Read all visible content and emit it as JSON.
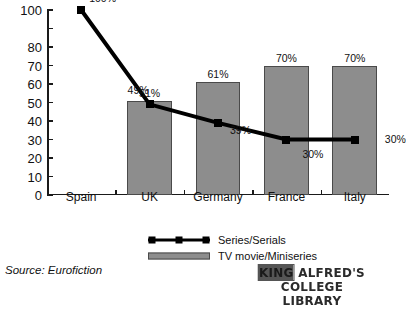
{
  "chart_data": {
    "type": "bar",
    "title": "",
    "xlabel": "",
    "ylabel": "",
    "ylim": [
      0,
      100
    ],
    "grid": false,
    "legend_position": "bottom-center",
    "categories": [
      "Spain",
      "UK",
      "Germany",
      "France",
      "Italy"
    ],
    "y_ticks": [
      {
        "value": 100,
        "label": "100"
      },
      {
        "value": 90,
        "label": ""
      },
      {
        "value": 80,
        "label": "80"
      },
      {
        "value": 70,
        "label": "70"
      },
      {
        "value": 60,
        "label": "60"
      },
      {
        "value": 50,
        "label": "50"
      },
      {
        "value": 40,
        "label": "40"
      },
      {
        "value": 30,
        "label": "30"
      },
      {
        "value": 20,
        "label": "20"
      },
      {
        "value": 10,
        "label": "10"
      },
      {
        "value": 0,
        "label": "0"
      }
    ],
    "series": [
      {
        "name": "Series/Serials",
        "type": "line",
        "values": [
          100,
          49,
          39,
          30,
          30
        ],
        "labels": [
          "100%",
          "49%",
          "39%",
          "30%",
          "30%"
        ]
      },
      {
        "name": "TV movie/Miniseries",
        "type": "bar",
        "values": [
          null,
          51,
          61,
          70,
          70
        ],
        "labels": [
          "",
          "51%",
          "61%",
          "70%",
          "70%"
        ]
      }
    ]
  },
  "legend": {
    "items": [
      {
        "label": "Series/Serials",
        "key": "line-marker-key"
      },
      {
        "label": "TV movie/Miniseries",
        "key": "bar-swatch-key"
      }
    ]
  },
  "source": {
    "text": "Source: Eurofiction"
  },
  "stamp": {
    "line1_smudged": "KING",
    "line1_rest": " ALFRED'S COLLEGE",
    "line2": "LIBRARY"
  }
}
